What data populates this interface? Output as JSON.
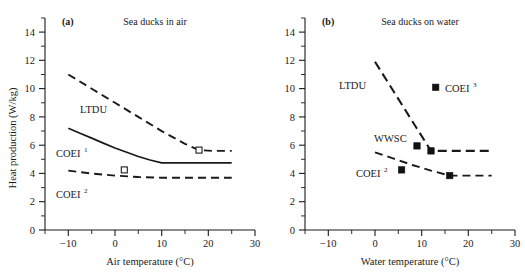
{
  "figure": {
    "y_axis_label": "Heat production (W/kg)",
    "y_ticks": [
      "0",
      "2",
      "4",
      "6",
      "8",
      "10",
      "12",
      "14"
    ],
    "background": "#ffffff",
    "ink_color": "#1a1a1a"
  },
  "panel_a": {
    "letter": "(a)",
    "title": "Sea ducks in air",
    "x_axis_label": "Air temperature (°C)",
    "x_ticks": [
      "−10",
      "0",
      "10",
      "20",
      "30"
    ],
    "labels": {
      "ltdu": "LTDU",
      "coei1_base": "COEI",
      "coei1_sup": "1",
      "coei2_base": "COEI",
      "coei2_sup": "2"
    }
  },
  "panel_b": {
    "letter": "(b)",
    "title": "Sea ducks on water",
    "x_axis_label": "Water temperature (°C)",
    "x_ticks": [
      "−10",
      "0",
      "10",
      "20",
      "30"
    ],
    "labels": {
      "ltdu": "LTDU",
      "wwsc": "WWSC",
      "coei2_base": "COEI",
      "coei2_sup": "2",
      "coei3_base": "COEI",
      "coei3_sup": "3"
    }
  },
  "chart_data": [
    {
      "type": "line",
      "panel": "(a)",
      "title": "Sea ducks in air",
      "xlabel": "Air temperature (°C)",
      "ylabel": "Heat production (W/kg)",
      "xlim": [
        -15,
        30
      ],
      "ylim": [
        0,
        15
      ],
      "xticks": [
        -10,
        0,
        10,
        20,
        30
      ],
      "xticks_minor": [
        -5,
        5,
        15,
        25
      ],
      "yticks": [
        0,
        2,
        4,
        6,
        8,
        10,
        12,
        14
      ],
      "yticks_minor": [
        1,
        3,
        5,
        7,
        9,
        11,
        13
      ],
      "grid": false,
      "legend": "inline-labels",
      "series": [
        {
          "name": "LTDU",
          "style": "dashed",
          "x": [
            -10,
            -5,
            0,
            5,
            10,
            15,
            18,
            21,
            25
          ],
          "values": [
            11.0,
            10.0,
            9.0,
            8.0,
            7.0,
            6.1,
            5.65,
            5.6,
            5.6
          ]
        },
        {
          "name": "COEI1",
          "style": "solid",
          "x": [
            -10,
            -7.5,
            -5,
            -2.5,
            0,
            2.5,
            5,
            7.5,
            10,
            15,
            20,
            25
          ],
          "values": [
            7.2,
            6.85,
            6.5,
            6.15,
            5.8,
            5.5,
            5.2,
            4.95,
            4.75,
            4.75,
            4.75,
            4.75
          ]
        },
        {
          "name": "COEI2",
          "style": "dashed",
          "x": [
            -10,
            -5,
            0,
            5,
            10,
            15,
            20,
            25
          ],
          "values": [
            4.2,
            4.0,
            3.85,
            3.75,
            3.7,
            3.7,
            3.7,
            3.7
          ]
        }
      ],
      "points": [
        {
          "label": "COEI2 observation",
          "marker": "open-square",
          "x": 2.0,
          "y": 4.25
        },
        {
          "label": "LTDU observation",
          "marker": "open-square",
          "x": 18.0,
          "y": 5.65
        }
      ]
    },
    {
      "type": "line",
      "panel": "(b)",
      "title": "Sea ducks on water",
      "xlabel": "Water temperature (°C)",
      "ylabel": "Heat production (W/kg)",
      "xlim": [
        -15,
        30
      ],
      "ylim": [
        0,
        15
      ],
      "xticks": [
        -10,
        0,
        10,
        20,
        30
      ],
      "xticks_minor": [
        -5,
        5,
        15,
        25
      ],
      "yticks": [
        0,
        2,
        4,
        6,
        8,
        10,
        12,
        14
      ],
      "yticks_minor": [
        1,
        3,
        5,
        7,
        9,
        11,
        13
      ],
      "grid": false,
      "legend": "inline-labels",
      "series": [
        {
          "name": "LTDU",
          "style": "dashed",
          "x": [
            0,
            4,
            8,
            12,
            16,
            20,
            25
          ],
          "values": [
            11.9,
            9.8,
            7.7,
            5.6,
            5.6,
            5.6,
            5.6
          ]
        },
        {
          "name": "COEI2",
          "style": "dashed",
          "x": [
            0,
            4,
            8,
            12,
            16,
            20,
            25
          ],
          "values": [
            5.5,
            5.05,
            4.6,
            4.2,
            3.85,
            3.85,
            3.85
          ]
        }
      ],
      "points": [
        {
          "label": "COEI3",
          "marker": "filled-square",
          "x": 13.0,
          "y": 10.1
        },
        {
          "label": "WWSC",
          "marker": "filled-square",
          "x": 9.0,
          "y": 5.95
        },
        {
          "label": "WWSC",
          "marker": "filled-square",
          "x": 12.0,
          "y": 5.6
        },
        {
          "label": "COEI2",
          "marker": "filled-square",
          "x": 5.7,
          "y": 4.25
        },
        {
          "label": "COEI2",
          "marker": "filled-square",
          "x": 16.0,
          "y": 3.85
        }
      ]
    }
  ]
}
